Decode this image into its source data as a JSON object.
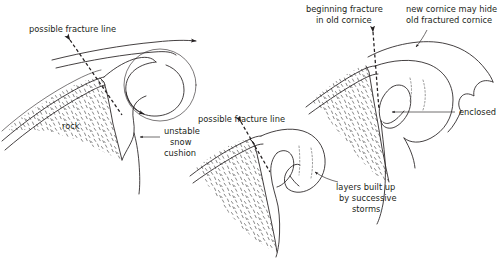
{
  "figure": {
    "background_color": "#ffffff",
    "ink_color": "#231f20",
    "panels": [
      {
        "id": "left",
        "name": "wind-flow-over-ridge",
        "labels": [
          {
            "key": "fracture",
            "text": "possible fracture line"
          },
          {
            "key": "rock",
            "text": "rock"
          },
          {
            "key": "cushion",
            "text": "unstable\nsnow\ncushion"
          }
        ]
      },
      {
        "id": "middle",
        "name": "cornice-layer-buildup",
        "labels": [
          {
            "key": "fracture",
            "text": "possible fracture line"
          },
          {
            "key": "layers",
            "text": "layers built up\nby successive\nstorms"
          }
        ]
      },
      {
        "id": "right",
        "name": "new-cornice-over-old",
        "labels": [
          {
            "key": "beginning",
            "text": "beginning fracture\nin old cornice"
          },
          {
            "key": "newcornice",
            "text": "new cornice may hide\nold fractured cornice"
          },
          {
            "key": "enclosed",
            "text": "enclosed"
          }
        ]
      }
    ]
  },
  "labels": {
    "left_fracture": "possible fracture line",
    "left_rock": "rock",
    "left_cushion_l1": "unstable",
    "left_cushion_l2": "snow",
    "left_cushion_l3": "cushion",
    "mid_fracture": "possible fracture line",
    "mid_layers_l1": "layers built up",
    "mid_layers_l2": "by successive",
    "mid_layers_l3": "storms",
    "right_begin_l1": "beginning fracture",
    "right_begin_l2": "in old cornice",
    "right_new_l1": "new cornice may hide",
    "right_new_l2": "old fractured cornice",
    "right_enclosed": "enclosed"
  }
}
